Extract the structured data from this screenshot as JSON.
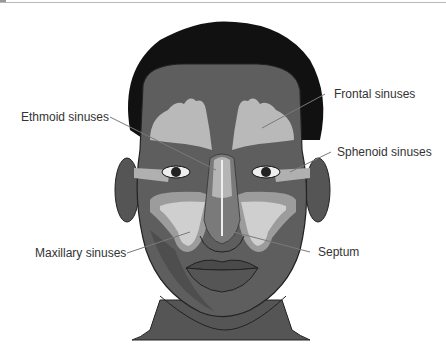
{
  "figure": {
    "labels": {
      "ethmoid": "Ethmoid sinuses",
      "frontal": "Frontal sinuses",
      "sphenoid": "Sphenoid sinuses",
      "maxillary": "Maxillary sinuses",
      "septum": "Septum"
    },
    "colors": {
      "hair": "#111111",
      "skin": "#5a5a5a",
      "skin_light": "#6e6e6e",
      "sinus": "#b9b9b9",
      "sinus_inner": "#d4d4d4",
      "leader": "#7a7a7a",
      "label_text": "#333333"
    }
  }
}
